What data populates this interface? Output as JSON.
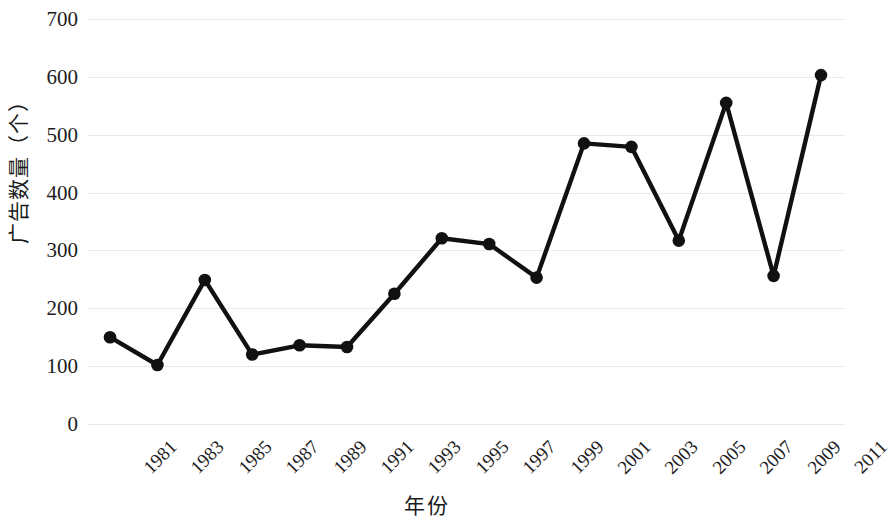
{
  "chart_data": {
    "type": "line",
    "title": "",
    "xlabel": "年份",
    "ylabel": "广告数量（个）",
    "categories": [
      "1981",
      "1983",
      "1985",
      "1987",
      "1989",
      "1991",
      "1993",
      "1995",
      "1997",
      "1999",
      "2001",
      "2003",
      "2005",
      "2007",
      "2009",
      "2011"
    ],
    "values": [
      150,
      102,
      249,
      120,
      136,
      133,
      225,
      321,
      311,
      253,
      485,
      479,
      317,
      555,
      256,
      603
    ],
    "series": [
      {
        "name": "广告数量",
        "values": [
          150,
          102,
          249,
          120,
          136,
          133,
          225,
          321,
          311,
          253,
          485,
          479,
          317,
          555,
          256,
          603
        ]
      }
    ],
    "ylim": [
      0,
      700
    ],
    "y_ticks": [
      0,
      100,
      200,
      300,
      400,
      500,
      600,
      700
    ],
    "y_tick_labels": [
      "0",
      "100",
      "200",
      "300",
      "400",
      "500",
      "600",
      "700"
    ],
    "grid": true,
    "grid_axis": "y",
    "legend": "none",
    "marker": "circle",
    "line_color": "#111111",
    "marker_color": "#111111",
    "grid_color": "#e9e9e9",
    "background_color": "#ffffff",
    "x_tick_rotation": -45
  }
}
